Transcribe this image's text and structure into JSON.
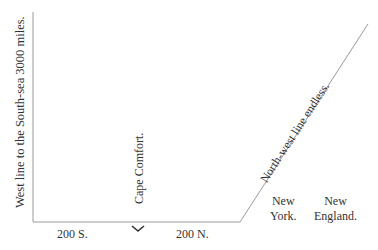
{
  "diagram": {
    "west_line_label": "West line to the South-sea 3000 miles.",
    "cape_label": "Cape Comfort.",
    "northwest_label": "North-west line endless.",
    "south_label": "200 S.",
    "north_label": "200 N.",
    "marker": "chevron-down",
    "new_york": [
      "New",
      "York."
    ],
    "new_england": [
      "New",
      "England."
    ],
    "line_color": "#999999",
    "text_color": "#333333"
  }
}
